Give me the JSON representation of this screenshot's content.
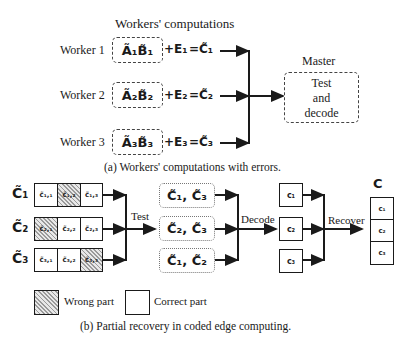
{
  "panel_a": {
    "heading": "Workers' computations",
    "workers": [
      {
        "label": "Worker 1",
        "product": "Ã₁B̃₁",
        "error": "+E₁",
        "result": "=C̃₁"
      },
      {
        "label": "Worker 2",
        "product": "Ã₂B̃₂",
        "error": "+E₂",
        "result": "=C̃₂"
      },
      {
        "label": "Worker 3",
        "product": "Ã₃B̃₃",
        "error": "+E₃",
        "result": "=C̃₃"
      }
    ],
    "master": {
      "title": "Master",
      "line1": "Test",
      "line2": "and",
      "line3": "decode"
    },
    "caption": "(a) Workers' computations with errors."
  },
  "panel_b": {
    "rows": [
      {
        "label": "C̃₁",
        "cells": [
          {
            "text": "c̃₁,₁",
            "wrong": false
          },
          {
            "text": "c̃₁,₂",
            "wrong": true
          },
          {
            "text": "c̃₁,₃",
            "wrong": false
          }
        ]
      },
      {
        "label": "C̃₂",
        "cells": [
          {
            "text": "c̃₂,₁",
            "wrong": true
          },
          {
            "text": "c̃₂,₂",
            "wrong": false
          },
          {
            "text": "c̃₂,₃",
            "wrong": false
          }
        ]
      },
      {
        "label": "C̃₃",
        "cells": [
          {
            "text": "c̃₃,₁",
            "wrong": false
          },
          {
            "text": "c̃₃,₂",
            "wrong": false
          },
          {
            "text": "c̃₃,₃",
            "wrong": true
          }
        ]
      }
    ],
    "test_label": "Test",
    "pairs": [
      "C̃₁, C̃₃",
      "C̃₂, C̃₃",
      "C̃₁, C̃₂"
    ],
    "decode_label": "Decode",
    "decoded": [
      "c₁",
      "c₂",
      "c₃"
    ],
    "recover_label": "Recover",
    "final_label": "C",
    "final_parts": [
      "c₁",
      "c₂",
      "c₃"
    ],
    "legend": {
      "wrong": "Wrong part",
      "correct": "Correct part"
    },
    "caption": "(b) Partial recovery in coded edge computing."
  }
}
